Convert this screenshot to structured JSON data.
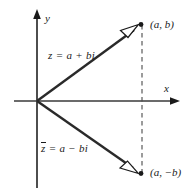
{
  "figure": {
    "type": "complex-plane-conjugate-diagram",
    "background_color": "#ffffff",
    "ink_color": "#1a1a1a",
    "width": 194,
    "height": 195,
    "axes": {
      "x_label": "x",
      "y_label": "y",
      "origin": {
        "x": 37,
        "y": 101
      },
      "x_axis": {
        "start_x": 14,
        "end_x": 180,
        "y": 101,
        "arrow": "right"
      },
      "y_axis": {
        "x": 37,
        "start_y": 10,
        "end_y": 188,
        "arrow": "up"
      }
    },
    "vectors": [
      {
        "name": "z-vector",
        "equation": "z = a + bi",
        "equation_parts": {
          "lhs": "z",
          "relation": "=",
          "rhs": "a + bi",
          "conjugate": false
        },
        "from": {
          "x": 37,
          "y": 101
        },
        "to": {
          "x": 141,
          "y": 25
        },
        "arrowhead": "hollow-triangle",
        "endpoint_marker": "filled-dot"
      },
      {
        "name": "z-conjugate-vector",
        "equation": "z̄ = a − bi",
        "equation_parts": {
          "lhs": "z",
          "relation": "=",
          "rhs": "a − bi",
          "conjugate": true
        },
        "from": {
          "x": 37,
          "y": 101
        },
        "to": {
          "x": 141,
          "y": 173
        },
        "arrowhead": "hollow-triangle",
        "endpoint_marker": "filled-dot"
      }
    ],
    "points": [
      {
        "name": "point-a-b",
        "label": "(a, b)",
        "x": 141,
        "y": 25
      },
      {
        "name": "point-a-minus-b",
        "label": "(a, −b)",
        "x": 141,
        "y": 173
      }
    ],
    "dashed_line": {
      "name": "vertical-dashed-connector",
      "x": 142,
      "from_y": 25,
      "to_y": 173,
      "style": "dashed"
    },
    "equation_text": {
      "z": "z",
      "z_rhs": " = a + bi",
      "z_conj": "z",
      "z_conj_rhs": " = a − bi"
    }
  }
}
